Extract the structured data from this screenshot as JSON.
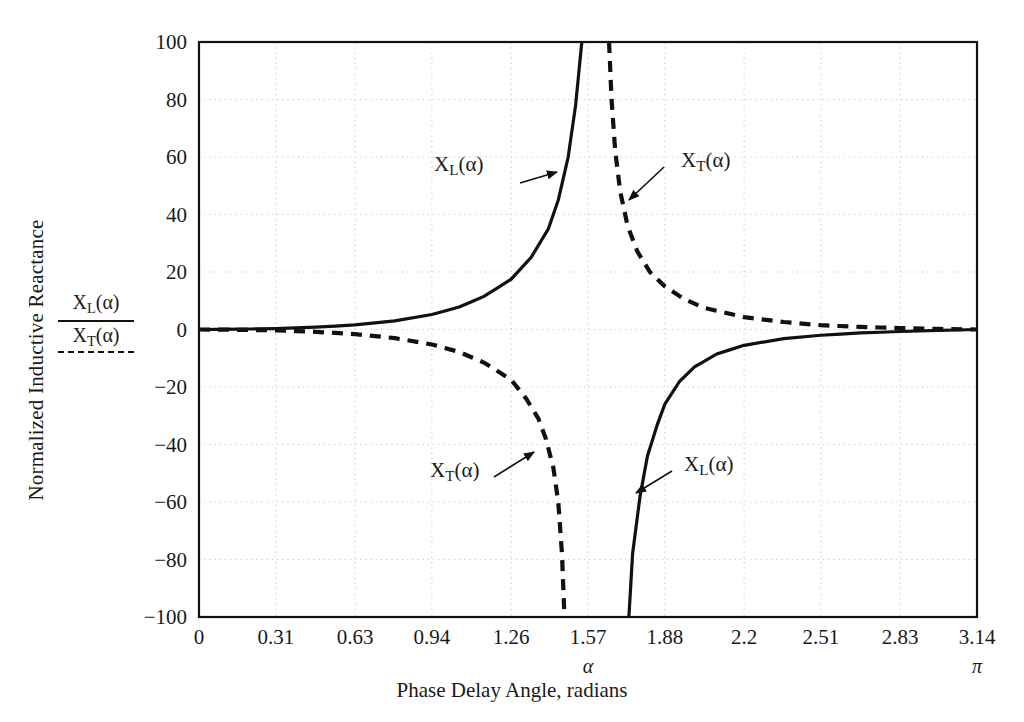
{
  "chart_data": {
    "type": "line",
    "title": "",
    "xlabel": "Phase Delay Angle, radians",
    "xlabel_symbol": "α",
    "ylabel": "Normalized Inductive Reactance",
    "xlim": [
      0,
      3.14
    ],
    "ylim": [
      -100,
      100
    ],
    "grid": true,
    "xticks": [
      "0",
      "0.31",
      "0.63",
      "0.94",
      "1.26",
      "1.57",
      "1.88",
      "2.2",
      "2.51",
      "2.83",
      "3.14"
    ],
    "xtick_values": [
      0,
      0.31,
      0.63,
      0.94,
      1.26,
      1.57,
      1.88,
      2.2,
      2.51,
      2.83,
      3.14
    ],
    "yticks": [
      "100",
      "80",
      "60",
      "40",
      "20",
      "0",
      "−20",
      "−40",
      "−60",
      "−80",
      "−100"
    ],
    "ytick_values": [
      100,
      80,
      60,
      40,
      20,
      0,
      -20,
      -40,
      -60,
      -80,
      -100
    ],
    "axis_annotations": [
      {
        "text": "α",
        "x": 1.57,
        "axis": "x"
      },
      {
        "text": "π",
        "x": 3.14,
        "axis": "x"
      }
    ],
    "legend": {
      "position": "y-axis-left",
      "numerator": "X_L(α)",
      "numerator_style": "solid",
      "denominator": "X_T(α)",
      "denominator_style": "dashed"
    },
    "series": [
      {
        "name": "X_L(α)",
        "style": "solid",
        "color": "#111111",
        "asymptote": 1.5708,
        "description": "Normalized inductive reactance of the thyristor-controlled reactor; rises to +infinity as alpha approaches pi/2 from below and returns from -infinity above pi/2, approaching 0 at alpha = pi.",
        "points_left": [
          [
            0.0,
            0.0
          ],
          [
            0.16,
            0.1
          ],
          [
            0.31,
            0.3
          ],
          [
            0.47,
            0.8
          ],
          [
            0.63,
            1.6
          ],
          [
            0.79,
            3.0
          ],
          [
            0.94,
            5.2
          ],
          [
            1.05,
            7.8
          ],
          [
            1.15,
            11.5
          ],
          [
            1.26,
            17.5
          ],
          [
            1.34,
            25.0
          ],
          [
            1.41,
            35.0
          ],
          [
            1.45,
            45.0
          ],
          [
            1.49,
            60.0
          ],
          [
            1.52,
            78.0
          ],
          [
            1.545,
            100.0
          ]
        ],
        "points_right": [
          [
            1.735,
            -100.0
          ],
          [
            1.75,
            -78.0
          ],
          [
            1.78,
            -58.0
          ],
          [
            1.81,
            -44.0
          ],
          [
            1.85,
            -33.0
          ],
          [
            1.88,
            -26.0
          ],
          [
            1.94,
            -18.0
          ],
          [
            2.0,
            -13.0
          ],
          [
            2.09,
            -8.5
          ],
          [
            2.2,
            -5.5
          ],
          [
            2.36,
            -3.2
          ],
          [
            2.51,
            -2.0
          ],
          [
            2.67,
            -1.2
          ],
          [
            2.83,
            -0.7
          ],
          [
            2.99,
            -0.3
          ],
          [
            3.14,
            0.0
          ]
        ]
      },
      {
        "name": "X_T(α)",
        "style": "dashed",
        "color": "#111111",
        "asymptote": 1.5708,
        "description": "Normalized total reactance; falls to -infinity as alpha approaches pi/2 from below and descends from +infinity above pi/2, approaching 0 at alpha = pi.",
        "points_left": [
          [
            0.0,
            0.0
          ],
          [
            0.16,
            -0.1
          ],
          [
            0.31,
            -0.3
          ],
          [
            0.47,
            -0.8
          ],
          [
            0.63,
            -1.6
          ],
          [
            0.79,
            -3.0
          ],
          [
            0.94,
            -5.2
          ],
          [
            1.05,
            -7.8
          ],
          [
            1.15,
            -11.5
          ],
          [
            1.26,
            -17.5
          ],
          [
            1.32,
            -24.0
          ],
          [
            1.37,
            -31.0
          ],
          [
            1.4,
            -38.0
          ],
          [
            1.43,
            -48.0
          ],
          [
            1.45,
            -60.0
          ],
          [
            1.465,
            -78.0
          ],
          [
            1.475,
            -100.0
          ]
        ],
        "points_right": [
          [
            1.655,
            100.0
          ],
          [
            1.665,
            80.0
          ],
          [
            1.68,
            62.0
          ],
          [
            1.7,
            48.0
          ],
          [
            1.73,
            36.0
          ],
          [
            1.77,
            27.0
          ],
          [
            1.82,
            20.0
          ],
          [
            1.88,
            15.0
          ],
          [
            1.96,
            10.5
          ],
          [
            2.04,
            7.5
          ],
          [
            2.2,
            4.3
          ],
          [
            2.36,
            2.6
          ],
          [
            2.51,
            1.5
          ],
          [
            2.67,
            0.9
          ],
          [
            2.83,
            0.5
          ],
          [
            2.99,
            0.2
          ],
          [
            3.14,
            0.0
          ]
        ]
      }
    ],
    "curve_annotations": [
      {
        "label": "X_L(α)",
        "series": "X_L(α)",
        "quadrant": "upper-left",
        "arrow": "right"
      },
      {
        "label": "X_T(α)",
        "series": "X_T(α)",
        "quadrant": "upper-right",
        "arrow": "down-left"
      },
      {
        "label": "X_T(α)",
        "series": "X_T(α)",
        "quadrant": "lower-left",
        "arrow": "up-right"
      },
      {
        "label": "X_L(α)",
        "series": "X_L(α)",
        "quadrant": "lower-right",
        "arrow": "down-left"
      }
    ],
    "colors": {
      "axis": "#111111",
      "grid": "#c8c8c8",
      "curve": "#111111",
      "background": "#ffffff"
    }
  },
  "labels": {
    "ylabel": "Normalized Inductive Reactance",
    "xlabel": "Phase Delay Angle, radians",
    "alpha": "α",
    "pi": "π",
    "xl_main": "X",
    "xl_sub": "L",
    "xl_arg": "(α)",
    "xt_main": "X",
    "xt_sub": "T",
    "xt_arg": "(α)"
  }
}
